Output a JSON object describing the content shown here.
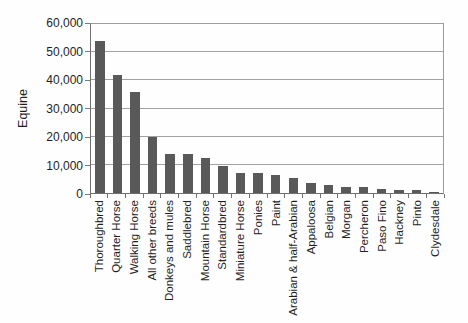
{
  "chart_data": {
    "type": "bar",
    "title": "",
    "xlabel": "",
    "ylabel": "Equine",
    "ylim": [
      0,
      60000
    ],
    "grid": true,
    "legend": "none",
    "bar_color": "#595959",
    "gridline_color": "#a2a2a2",
    "yticks": [
      {
        "value": 0,
        "label": "0"
      },
      {
        "value": 10000,
        "label": "10,000"
      },
      {
        "value": 20000,
        "label": "20,000"
      },
      {
        "value": 30000,
        "label": "30,000"
      },
      {
        "value": 40000,
        "label": "40,000"
      },
      {
        "value": 50000,
        "label": "50,000"
      },
      {
        "value": 60000,
        "label": "60,000"
      }
    ],
    "categories": [
      "Thoroughbred",
      "Quarter Horse",
      "Walking Horse",
      "All other breeds",
      "Donkeys and mules",
      "Saddlebred",
      "Mountain Horse",
      "Standardbred",
      "Miniature Horse",
      "Ponies",
      "Paint",
      "Arabian & half-Arabian",
      "Appaloosa",
      "Belgian",
      "Morgan",
      "Percheron",
      "Paso Fino",
      "Hackney",
      "Pinto",
      "Clydesdale"
    ],
    "values": [
      54000,
      42000,
      36000,
      20000,
      14000,
      14000,
      12500,
      9500,
      7000,
      7000,
      6500,
      5500,
      3500,
      3000,
      2000,
      2000,
      1500,
      1000,
      1000,
      500
    ]
  }
}
